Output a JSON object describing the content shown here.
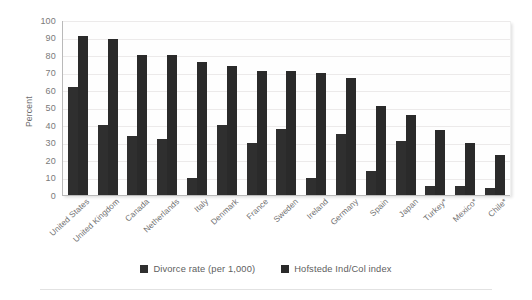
{
  "chart_data": {
    "type": "bar",
    "title": "",
    "subtitle": "",
    "xlabel": "",
    "ylabel": "Percent",
    "ylim": [
      0,
      100
    ],
    "ytick_step": 10,
    "yticks": [
      100,
      90,
      80,
      70,
      60,
      50,
      40,
      30,
      20,
      10,
      0
    ],
    "grid": true,
    "legend_position": "bottom-center",
    "categories": [
      "United States",
      "United Kingdom",
      "Canada",
      "Netherlands",
      "Italy",
      "Denmark",
      "France",
      "Sweden",
      "Ireland",
      "Germany",
      "Spain",
      "Japan",
      "Turkey*",
      "Mexico*",
      "Chile*"
    ],
    "series": [
      {
        "name": "Divorce rate (per 1,000)",
        "color": "#2f2f2f",
        "values": [
          62,
          40,
          34,
          32,
          10,
          40,
          30,
          38,
          10,
          35,
          14,
          31,
          5,
          5,
          4
        ]
      },
      {
        "name": "Hofstede Ind/Col index",
        "color": "#2a2a2a",
        "values": [
          91,
          89,
          80,
          80,
          76,
          74,
          71,
          71,
          70,
          67,
          51,
          46,
          37,
          30,
          23
        ]
      }
    ]
  },
  "legend": {
    "items": [
      {
        "label": "Divorce rate (per 1,000)",
        "swatch": "legend-swatch-divorce"
      },
      {
        "label": "Hofstede Ind/Col index",
        "swatch": "legend-swatch-hofstede"
      }
    ]
  },
  "colors": {
    "bar": "#2d2d2d",
    "gridline": "#eceaea",
    "axis": "#b9b9b9",
    "tick_text": "#7a7a7a",
    "legend_text": "#5e5e5e",
    "plot_background": "#fefefe",
    "page_background": "#ffffff"
  }
}
